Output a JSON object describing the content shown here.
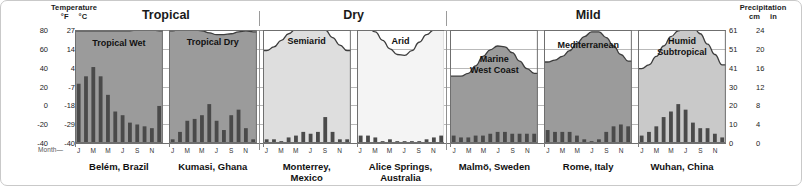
{
  "header": {
    "temperature_title": "Temperature",
    "temp_unit_f": "°F",
    "temp_unit_c": "°C",
    "precipitation_title": "Precipitation",
    "precip_unit_cm": "cm",
    "precip_unit_in": "in",
    "month_axis_label": "Month",
    "month_axis_dash": "—"
  },
  "groups": [
    {
      "label": "Tropical"
    },
    {
      "label": "Dry"
    },
    {
      "label": "Mild"
    }
  ],
  "chart_data": {
    "type": "bar",
    "xlabel": "Month",
    "ylabel": "Temperature",
    "y2label": "Precipitation",
    "grid": true,
    "legend_position": "none",
    "month_ticks": [
      "J",
      "M",
      "M",
      "J",
      "S",
      "N"
    ],
    "month_tick_indices": [
      0,
      2,
      4,
      6,
      8,
      10
    ],
    "months_all": [
      "J",
      "F",
      "M",
      "A",
      "M",
      "J",
      "J",
      "A",
      "S",
      "O",
      "N",
      "D"
    ],
    "temp_axis_f": {
      "label": "°F",
      "ticks": [
        80,
        60,
        40,
        20,
        0,
        -20,
        -40
      ],
      "range": [
        -40,
        80
      ]
    },
    "temp_axis_c": {
      "label": "°C",
      "ticks": [
        27,
        14,
        4,
        -7,
        -18,
        -29,
        -40
      ],
      "range": [
        -40,
        27
      ]
    },
    "precip_axis_cm": {
      "label": "cm",
      "ticks": [
        61,
        51,
        41,
        30,
        20,
        10,
        0
      ],
      "range": [
        0,
        61
      ]
    },
    "precip_axis_in": {
      "label": "in",
      "ticks": [
        24,
        20,
        16,
        12,
        8,
        4,
        0
      ],
      "range": [
        0,
        24
      ]
    },
    "panels": [
      {
        "climate": "Tropical Wet",
        "climate_lines": [
          "Tropical Wet"
        ],
        "city": "Belém, Brazil",
        "city_lines": [
          "Belém, Brazil"
        ],
        "group": "Tropical",
        "fill": "#9b9b9b",
        "temperature_f": [
          79,
          79,
          79,
          79,
          79,
          79,
          79,
          79,
          80,
          80,
          80,
          79
        ],
        "precipitation_cm": [
          32,
          36,
          41,
          36,
          26,
          17,
          15,
          11,
          10,
          9,
          8,
          20
        ]
      },
      {
        "climate": "Tropical Dry",
        "climate_lines": [
          "Tropical Dry"
        ],
        "city": "Kumasi, Ghana",
        "city_lines": [
          "Kumasi, Ghana"
        ],
        "group": "Tropical",
        "fill": "#9b9b9b",
        "temperature_f": [
          79,
          81,
          81,
          80,
          79,
          77,
          75,
          75,
          76,
          78,
          79,
          78
        ],
        "precipitation_cm": [
          2,
          6,
          12,
          13,
          15,
          21,
          12,
          7,
          15,
          18,
          8,
          2
        ]
      },
      {
        "climate": "Semiarid",
        "climate_lines": [
          "Semiarid"
        ],
        "city": "Monterrey, Mexico",
        "city_lines": [
          "Monterrey,",
          "Mexico"
        ],
        "group": "Dry",
        "fill": "#dedede",
        "temperature_f": [
          58,
          62,
          69,
          76,
          81,
          84,
          85,
          85,
          80,
          72,
          64,
          58
        ],
        "precipitation_cm": [
          2,
          2,
          1,
          3,
          4,
          6,
          5,
          6,
          14,
          6,
          2,
          2
        ]
      },
      {
        "climate": "Arid",
        "climate_lines": [
          "Arid"
        ],
        "city": "Alice Springs, Australia",
        "city_lines": [
          "Alice Springs,",
          "Australia"
        ],
        "group": "Dry",
        "fill": "#f4f4f4",
        "temperature_f": [
          84,
          82,
          78,
          69,
          60,
          54,
          53,
          58,
          67,
          75,
          80,
          83
        ],
        "precipitation_cm": [
          4,
          4,
          3,
          1,
          2,
          1,
          1,
          1,
          1,
          2,
          3,
          4
        ]
      },
      {
        "climate": "Marine West Coast",
        "climate_lines": [
          "Marine",
          "West Coast"
        ],
        "city": "Malmö, Sweden",
        "city_lines": [
          "Malmö, Sweden"
        ],
        "group": "Mild",
        "fill": "#9b9b9b",
        "temperature_f": [
          31,
          31,
          34,
          42,
          52,
          59,
          63,
          62,
          56,
          47,
          39,
          34
        ],
        "precipitation_cm": [
          4,
          3,
          3,
          4,
          4,
          5,
          6,
          6,
          5,
          5,
          5,
          5
        ]
      },
      {
        "climate": "Mediterranean",
        "climate_lines": [
          "Mediterranean"
        ],
        "city": "Rome, Italy",
        "city_lines": [
          "Rome, Italy"
        ],
        "group": "Mild",
        "fill": "#9b9b9b",
        "temperature_f": [
          46,
          48,
          52,
          58,
          66,
          73,
          78,
          78,
          72,
          63,
          54,
          47
        ],
        "precipitation_cm": [
          7,
          6,
          6,
          6,
          4,
          2,
          1,
          2,
          6,
          9,
          10,
          9
        ]
      },
      {
        "climate": "Humid Subtropical",
        "climate_lines": [
          "Humid",
          "Subtropical"
        ],
        "city": "Wuhan, China",
        "city_lines": [
          "Wuhan, China"
        ],
        "group": "Mild",
        "fill": "#c9c9c9",
        "temperature_f": [
          39,
          43,
          52,
          63,
          73,
          79,
          85,
          84,
          76,
          65,
          54,
          43
        ],
        "precipitation_cm": [
          4,
          6,
          9,
          14,
          17,
          21,
          18,
          11,
          8,
          8,
          5,
          3
        ]
      }
    ]
  }
}
